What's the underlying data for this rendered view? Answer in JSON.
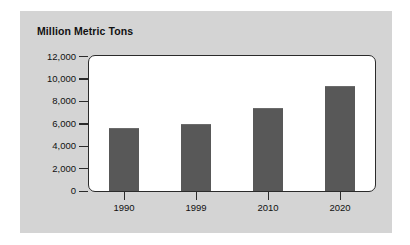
{
  "figure": {
    "panel_background": "#d4d4d4",
    "plot_background": "#ffffff",
    "page_background": "#ffffff"
  },
  "chart_data": {
    "type": "bar",
    "title": "Million Metric Tons",
    "subtitle": "",
    "xlabel": "",
    "ylabel": "Million Metric Tons",
    "categories": [
      "1990",
      "1999",
      "2010",
      "2020"
    ],
    "values": [
      5600,
      6000,
      7400,
      9400
    ],
    "series": [
      {
        "name": "Million Metric Tons",
        "values": [
          5600,
          6000,
          7400,
          9400
        ]
      }
    ],
    "ylim": [
      0,
      12000
    ],
    "ytick_values": [
      0,
      2000,
      4000,
      6000,
      8000,
      10000,
      12000
    ],
    "ytick_labels": [
      "0",
      "2,000",
      "4,000",
      "6,000",
      "8,000",
      "10,000",
      "12,000"
    ],
    "xtick_labels": [
      "1990",
      "1999",
      "2010",
      "2020"
    ],
    "grid": false,
    "legend": false,
    "legend_position": "none",
    "bar_color": "#585858",
    "axis_color": "#2b2b2b",
    "text_color": "#111111",
    "annotations": []
  }
}
